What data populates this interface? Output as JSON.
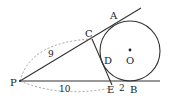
{
  "diagram": {
    "type": "geometry-tangent-circle",
    "points": {
      "P": {
        "label": "P"
      },
      "A": {
        "label": "A"
      },
      "B": {
        "label": "B"
      },
      "C": {
        "label": "C"
      },
      "D": {
        "label": "D"
      },
      "E": {
        "label": "E"
      },
      "O": {
        "label": "O"
      }
    },
    "measurements": {
      "PC": "9",
      "PE": "10",
      "EB": "2"
    },
    "colors": {
      "stroke": "#333333",
      "dashed": "#888888",
      "background": "#ffffff"
    }
  }
}
